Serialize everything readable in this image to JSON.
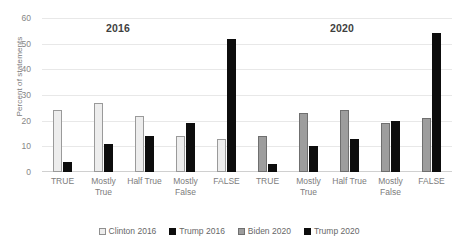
{
  "chart_data": {
    "type": "bar",
    "title": "",
    "xlabel": "",
    "ylabel": "Percent of statements",
    "ylim": [
      0,
      60
    ],
    "yticks": [
      0,
      10,
      20,
      30,
      40,
      50,
      60
    ],
    "grid": true,
    "legend_position": "bottom",
    "categories": [
      "TRUE",
      "Mostly True",
      "Half True",
      "Mostly False",
      "FALSE"
    ],
    "category_groups": [
      "2016",
      "2020"
    ],
    "annotations": [
      {
        "text": "2016",
        "group": "left"
      },
      {
        "text": "2020",
        "group": "right"
      }
    ],
    "series": [
      {
        "name": "Clinton 2016",
        "color": "#ededed",
        "era": "2016",
        "values": [
          24,
          27,
          22,
          14,
          13
        ]
      },
      {
        "name": "Trump 2016",
        "color": "#0d0d0d",
        "era": "2016",
        "values": [
          4,
          11,
          14,
          19,
          52
        ]
      },
      {
        "name": "Biden 2020",
        "color": "#9d9d9d",
        "era": "2020",
        "values": [
          14,
          23,
          24,
          19,
          21
        ]
      },
      {
        "name": "Trump 2020",
        "color": "#0d0d0d",
        "era": "2020",
        "values": [
          3,
          10,
          13,
          20,
          54
        ]
      }
    ]
  },
  "axis": {
    "y_title": "Percent of statements",
    "ticks": {
      "t0": "0",
      "t10": "10",
      "t20": "20",
      "t30": "30",
      "t40": "40",
      "t50": "50",
      "t60": "60"
    }
  },
  "eras": {
    "left": "2016",
    "right": "2020"
  },
  "xlabels_2016": {
    "c0_l1": "TRUE",
    "c0_l2": "",
    "c1_l1": "Mostly",
    "c1_l2": "True",
    "c2_l1": "Half True",
    "c2_l2": "",
    "c3_l1": "Mostly",
    "c3_l2": "False",
    "c4_l1": "FALSE",
    "c4_l2": ""
  },
  "xlabels_2020": {
    "c0_l1": "TRUE",
    "c0_l2": "",
    "c1_l1": "Mostly",
    "c1_l2": "True",
    "c2_l1": "Half True",
    "c2_l2": "",
    "c3_l1": "Mostly",
    "c3_l2": "False",
    "c4_l1": "FALSE",
    "c4_l2": ""
  },
  "legend": {
    "items": [
      {
        "label": "Clinton 2016"
      },
      {
        "label": "Trump 2016"
      },
      {
        "label": "Biden 2020"
      },
      {
        "label": "Trump 2020"
      }
    ]
  }
}
